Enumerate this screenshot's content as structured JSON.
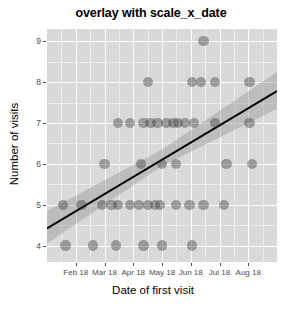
{
  "chart_data": {
    "type": "scatter",
    "title": "overlay with scale_x_date",
    "xlabel": "Date of first visit",
    "ylabel": "Number of visits",
    "grid": true,
    "legend": false,
    "ylim": [
      3.6,
      9.3
    ],
    "yticks": [
      4,
      5,
      6,
      7,
      8,
      9
    ],
    "ytick_labels": [
      "4",
      "5",
      "6",
      "7",
      "8",
      "9"
    ],
    "xticks": [
      "Feb 18",
      "Mar 18",
      "Apr 18",
      "May 18",
      "Jun 18",
      "Jul 18",
      "Aug 18"
    ],
    "xtick_labels": [
      "Feb 18",
      "Mar 18",
      "Apr 18",
      "May 18",
      "Jun 18",
      "Jul 18",
      "Aug 18"
    ],
    "xlim": [
      "Jan 18",
      "Sep 18"
    ],
    "point_color": "#3c3c3c",
    "point_alpha": 0.42,
    "panel_color": "#d9d9d9",
    "grid_color": "#ffffff",
    "trend_line_color": "#000000",
    "ribbon_color": "#999999",
    "series": [
      {
        "name": "visits",
        "points": [
          {
            "x": 0.08,
            "y": 4
          },
          {
            "x": 0.2,
            "y": 4
          },
          {
            "x": 0.3,
            "y": 4
          },
          {
            "x": 0.42,
            "y": 4
          },
          {
            "x": 0.5,
            "y": 4
          },
          {
            "x": 0.63,
            "y": 4
          },
          {
            "x": 0.07,
            "y": 5
          },
          {
            "x": 0.15,
            "y": 5
          },
          {
            "x": 0.24,
            "y": 5
          },
          {
            "x": 0.28,
            "y": 5
          },
          {
            "x": 0.31,
            "y": 5
          },
          {
            "x": 0.36,
            "y": 5
          },
          {
            "x": 0.4,
            "y": 5
          },
          {
            "x": 0.44,
            "y": 5
          },
          {
            "x": 0.47,
            "y": 5
          },
          {
            "x": 0.49,
            "y": 5
          },
          {
            "x": 0.56,
            "y": 5
          },
          {
            "x": 0.62,
            "y": 5
          },
          {
            "x": 0.68,
            "y": 5
          },
          {
            "x": 0.77,
            "y": 5
          },
          {
            "x": 0.25,
            "y": 6
          },
          {
            "x": 0.41,
            "y": 6
          },
          {
            "x": 0.5,
            "y": 6
          },
          {
            "x": 0.56,
            "y": 6
          },
          {
            "x": 0.78,
            "y": 6
          },
          {
            "x": 0.89,
            "y": 6
          },
          {
            "x": 0.31,
            "y": 7
          },
          {
            "x": 0.36,
            "y": 7
          },
          {
            "x": 0.42,
            "y": 7
          },
          {
            "x": 0.45,
            "y": 7
          },
          {
            "x": 0.48,
            "y": 7
          },
          {
            "x": 0.52,
            "y": 7
          },
          {
            "x": 0.55,
            "y": 7
          },
          {
            "x": 0.57,
            "y": 7
          },
          {
            "x": 0.6,
            "y": 7
          },
          {
            "x": 0.64,
            "y": 7
          },
          {
            "x": 0.73,
            "y": 7
          },
          {
            "x": 0.88,
            "y": 7
          },
          {
            "x": 0.44,
            "y": 8
          },
          {
            "x": 0.63,
            "y": 8
          },
          {
            "x": 0.67,
            "y": 8
          },
          {
            "x": 0.73,
            "y": 8
          },
          {
            "x": 0.88,
            "y": 8
          },
          {
            "x": 0.68,
            "y": 9
          }
        ]
      }
    ],
    "trend_line": {
      "name": "linear fit",
      "x_start": 0.0,
      "y_start": 4.42,
      "x_end": 1.0,
      "y_end": 7.78
    },
    "confidence_ribbon": {
      "name": "95% confidence interval",
      "lower": [
        {
          "x": 0.0,
          "y": 4.05
        },
        {
          "x": 0.5,
          "y": 5.95
        },
        {
          "x": 1.0,
          "y": 7.35
        }
      ],
      "upper": [
        {
          "x": 0.0,
          "y": 4.85
        },
        {
          "x": 0.5,
          "y": 6.35
        },
        {
          "x": 1.0,
          "y": 8.25
        }
      ]
    }
  }
}
